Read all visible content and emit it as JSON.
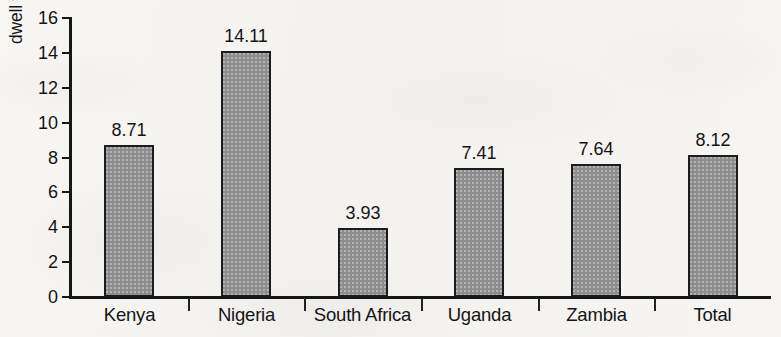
{
  "chart_data": {
    "type": "bar",
    "title": "",
    "xlabel": "",
    "ylabel": "dwell time (number of days)",
    "categories": [
      "Kenya",
      "Nigeria",
      "South Africa",
      "Uganda",
      "Zambia",
      "Total"
    ],
    "values": [
      8.71,
      14.11,
      3.93,
      7.41,
      7.64,
      8.12
    ],
    "value_labels": [
      "8.71",
      "14.11",
      "3.93",
      "7.41",
      "7.64",
      "8.12"
    ],
    "ylim": [
      0,
      16
    ],
    "y_ticks": [
      0,
      2,
      4,
      6,
      8,
      10,
      12,
      14,
      16
    ],
    "y_tick_labels": [
      "0",
      "2",
      "4",
      "6",
      "8",
      "10",
      "12",
      "14",
      "16"
    ],
    "grid": false,
    "legend": false,
    "legend_position": "none",
    "bar_fill_color": "#8d8d8d",
    "bar_border_color": "#1b1b20",
    "axis_color": "#15151a",
    "text_color": "#141418",
    "background_color": "#f7f5f1"
  }
}
